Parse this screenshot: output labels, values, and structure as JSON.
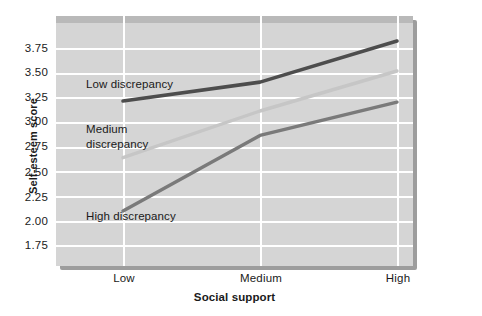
{
  "chart_data": {
    "type": "line",
    "title": "",
    "xlabel": "Social support",
    "ylabel": "Self-esteem score",
    "categories": [
      "Low",
      "Medium",
      "High"
    ],
    "ylim": [
      1.625,
      3.875
    ],
    "yticks": [
      3.75,
      3.5,
      3.25,
      3.0,
      2.75,
      2.5,
      2.25,
      2.0,
      1.75
    ],
    "ytick_labels": [
      "3.75",
      "3.50",
      "3.25",
      "3.00",
      "2.75",
      "2.50",
      "2.25",
      "2.00",
      "1.75"
    ],
    "grid": true,
    "legend_position": "inline-annotations",
    "series": [
      {
        "name": "Low discrepancy",
        "label": "Low discrepancy",
        "color": "#4d4d4d",
        "values": [
          3.11,
          3.28,
          3.65
        ]
      },
      {
        "name": "Medium discrepancy",
        "label": "Medium discrepancy",
        "label_line1": "Medium",
        "label_line2": "discrepancy",
        "color": "#c6c6c6",
        "values": [
          2.6,
          3.02,
          3.38
        ]
      },
      {
        "name": "High discrepancy",
        "label": "High discrepancy",
        "color": "#7a7a7a",
        "values": [
          2.12,
          2.8,
          3.1
        ]
      }
    ]
  },
  "annotations": {
    "low_discrepancy": "Low discrepancy",
    "medium_discrepancy_line1": "Medium",
    "medium_discrepancy_line2": "discrepancy",
    "high_discrepancy": "High discrepancy"
  },
  "axes": {
    "y_title": "Self-esteem score",
    "x_title": "Social support",
    "x_tick_labels": [
      "Low",
      "Medium",
      "High"
    ],
    "y_tick_labels": [
      "3.75",
      "3.50",
      "3.25",
      "3.00",
      "2.75",
      "2.50",
      "2.25",
      "2.00",
      "1.75"
    ]
  },
  "colors": {
    "plot_background": "#d5d5d5",
    "gridline": "#ffffff",
    "shadow": "#9d9d9d",
    "top_band": "#b9b9b9",
    "text": "#1a1a1a",
    "series_low": "#4d4d4d",
    "series_medium": "#c6c6c6",
    "series_high": "#7a7a7a"
  }
}
